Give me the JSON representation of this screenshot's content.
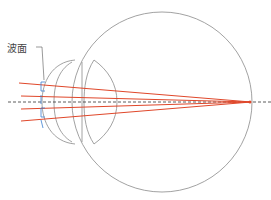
{
  "diagram": {
    "label_wavefront": "波面",
    "colors": {
      "outline": "#8a8a8a",
      "ray": "#e0472a",
      "wavefront": "#3b7fd0",
      "axis": "#333333"
    },
    "elements": [
      "eyeball",
      "cornea",
      "iris",
      "lens",
      "optical-axis",
      "light-rays",
      "wavefront",
      "focal-point"
    ]
  }
}
